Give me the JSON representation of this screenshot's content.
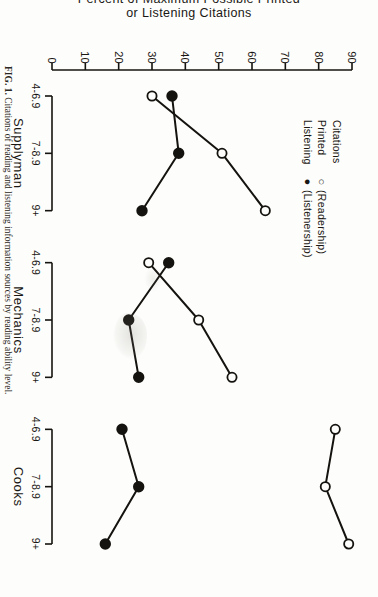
{
  "figure": {
    "caption_label": "FIG. 1.",
    "caption_text": "Citations of reading and listening information sources by reading ability level."
  },
  "legend": {
    "header": "Citations",
    "entries": [
      {
        "key": "Printed",
        "symbol": "open-circle",
        "glyph": "○",
        "note": "(Readership)"
      },
      {
        "key": "Listening",
        "symbol": "filled-circle",
        "glyph": "●",
        "note": "(Listenership)"
      }
    ]
  },
  "chart_data": {
    "type": "line",
    "title": "",
    "xlabel": "",
    "ylabel": "Percent of Maximum Possible Printed or Listening Citations",
    "ylabel_line1": "Percent of Maximum Possible Printed",
    "ylabel_line2": "or Listening Citations",
    "ylim": [
      0,
      90
    ],
    "yticks": [
      0,
      10,
      20,
      30,
      40,
      50,
      60,
      70,
      80,
      90
    ],
    "grid": false,
    "legend_position": "top-left",
    "groups": [
      "Supplyman",
      "Mechanics",
      "Cooks"
    ],
    "categories": [
      "4-6.9",
      "7-8.9",
      "9+"
    ],
    "x": [
      "Supplyman 4-6.9",
      "Supplyman 7-8.9",
      "Supplyman 9+",
      "Mechanics 4-6.9",
      "Mechanics 7-8.9",
      "Mechanics 9+",
      "Cooks 4-6.9",
      "Cooks 7-8.9",
      "Cooks 9+"
    ],
    "series": [
      {
        "name": "Printed (Readership)",
        "marker": "open-circle",
        "values_by_group": {
          "Supplyman": [
            30,
            51,
            64
          ],
          "Mechanics": [
            29,
            44,
            54
          ],
          "Cooks": [
            85,
            82,
            89
          ]
        }
      },
      {
        "name": "Listening (Listenership)",
        "marker": "filled-circle",
        "values_by_group": {
          "Supplyman": [
            36,
            38,
            27
          ],
          "Mechanics": [
            35,
            23,
            26
          ],
          "Cooks": [
            21,
            26,
            16
          ]
        }
      }
    ]
  },
  "colors": {
    "ink": "#15130f",
    "paper": "#fdfdfb"
  }
}
